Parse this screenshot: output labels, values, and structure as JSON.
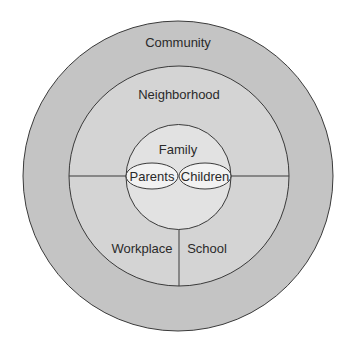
{
  "diagram": {
    "type": "concentric-circles",
    "colors": {
      "background": "#ffffff",
      "community_fill": "#c4c4c4",
      "neighborhood_fill": "#d4d4d4",
      "family_fill": "#e2e2e2",
      "oval_fill": "#f2f2f2",
      "stroke": "#3a3a3a"
    },
    "rings": [
      {
        "id": "community",
        "label": "Community"
      },
      {
        "id": "neighborhood",
        "label": "Neighborhood"
      },
      {
        "id": "family",
        "label": "Family"
      }
    ],
    "family_members": [
      {
        "id": "parents",
        "label": "Parents"
      },
      {
        "id": "children",
        "label": "Children"
      }
    ],
    "sectors": [
      {
        "id": "workplace",
        "label": "Workplace"
      },
      {
        "id": "school",
        "label": "School"
      }
    ]
  }
}
